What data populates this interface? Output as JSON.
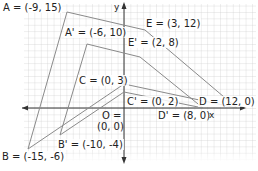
{
  "diagram": {
    "type": "coordinate-plane-dilation",
    "axes": {
      "x_label": "x",
      "y_label": "y"
    },
    "origin_label": {
      "line1": "O =",
      "line2": "(0, 0)"
    },
    "original_figure": {
      "name": "ABCDE",
      "points": [
        {
          "id": "A",
          "label": "A = (-9, 15)",
          "x": -9,
          "y": 15
        },
        {
          "id": "B",
          "label": "B = (-15, -6)",
          "x": -15,
          "y": -6
        },
        {
          "id": "C",
          "label": "C = (0, 3)",
          "x": 0,
          "y": 3
        },
        {
          "id": "D",
          "label": "D = (12, 0)",
          "x": 12,
          "y": 0
        },
        {
          "id": "E",
          "label": "E = (3, 12)",
          "x": 3,
          "y": 12
        }
      ]
    },
    "image_figure": {
      "name": "A'B'C'D'E'",
      "points": [
        {
          "id": "A'",
          "label": "A' = (-6, 10)",
          "x": -6,
          "y": 10
        },
        {
          "id": "B'",
          "label": "B' = (-10, -4)",
          "x": -10,
          "y": -4
        },
        {
          "id": "C'",
          "label": "C' = (0, 2)",
          "x": 0,
          "y": 2
        },
        {
          "id": "D'",
          "label": "D' = (8, 0)",
          "x": 8,
          "y": 0
        },
        {
          "id": "E'",
          "label": "E' = (2, 8)",
          "x": 2,
          "y": 8
        }
      ]
    },
    "colors": {
      "grid": "#c8c8c8",
      "axis": "#333333",
      "figure_line": "#8a8a8a",
      "text": "#222222"
    }
  }
}
